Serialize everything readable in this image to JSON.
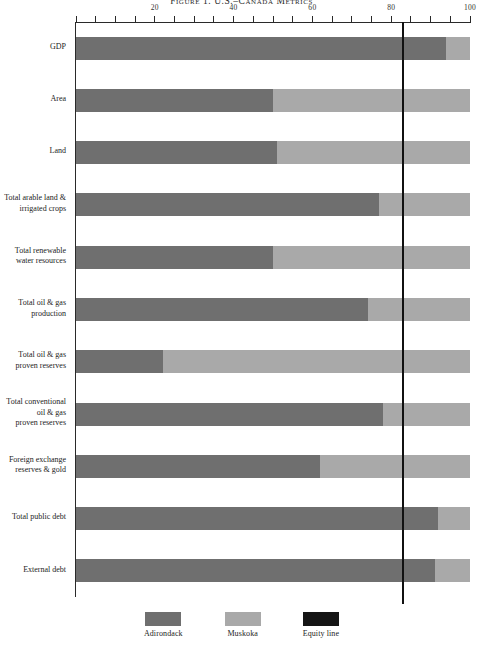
{
  "figure": {
    "title": "Figure 1. U.S.–Canada Metrics"
  },
  "axis": {
    "ticks": [
      {
        "value": 0,
        "label": ""
      },
      {
        "value": 5,
        "label": ""
      },
      {
        "value": 10,
        "label": ""
      },
      {
        "value": 15,
        "label": ""
      },
      {
        "value": 20,
        "label": "20"
      },
      {
        "value": 25,
        "label": ""
      },
      {
        "value": 30,
        "label": ""
      },
      {
        "value": 35,
        "label": ""
      },
      {
        "value": 40,
        "label": "40"
      },
      {
        "value": 45,
        "label": ""
      },
      {
        "value": 50,
        "label": ""
      },
      {
        "value": 55,
        "label": ""
      },
      {
        "value": 60,
        "label": "60"
      },
      {
        "value": 65,
        "label": ""
      },
      {
        "value": 70,
        "label": ""
      },
      {
        "value": 75,
        "label": ""
      },
      {
        "value": 80,
        "label": "80"
      },
      {
        "value": 85,
        "label": ""
      },
      {
        "value": 90,
        "label": ""
      },
      {
        "value": 95,
        "label": ""
      },
      {
        "value": 100,
        "label": "100"
      }
    ]
  },
  "legend": {
    "entries": [
      {
        "label": "Adirondack",
        "color": "#6f6f6f",
        "name": "legend-adirondack"
      },
      {
        "label": "Muskoka",
        "color": "#a9a9a9",
        "name": "legend-muskoka"
      },
      {
        "label": "Equity line",
        "color": "#151515",
        "name": "legend-equity-line"
      }
    ]
  },
  "colors": {
    "adirondack": "#6f6f6f",
    "muskoka": "#a9a9a9",
    "equity_line": "#111111",
    "axis": "#2a2a2a",
    "text": "#232323"
  },
  "chart_data": {
    "type": "bar",
    "orientation": "horizontal",
    "stacked": true,
    "normalized": true,
    "title": "Figure 1. U.S.–Canada Metrics",
    "xlabel": "",
    "ylabel": "",
    "xlim": [
      0,
      100
    ],
    "xticks": [
      0,
      20,
      40,
      60,
      80,
      100
    ],
    "grid": false,
    "legend_position": "bottom",
    "equity_line": 83,
    "categories": [
      "GDP",
      "Area",
      "Land",
      "Total arable land & irrigated crops",
      "Total renewable water resources",
      "Total oil & gas production",
      "Total oil & gas proven reserves",
      "Total conventional oil & gas proven reserves",
      "Foreign exchange reserves & gold",
      "Total public debt",
      "External debt"
    ],
    "category_lines": [
      [
        "GDP"
      ],
      [
        "Area"
      ],
      [
        "Land"
      ],
      [
        "Total arable land &",
        "irrigated crops"
      ],
      [
        "Total renewable",
        "water resources"
      ],
      [
        "Total oil & gas",
        "production"
      ],
      [
        "Total oil & gas",
        "proven reserves"
      ],
      [
        "Total conventional",
        "oil & gas",
        "proven reserves"
      ],
      [
        "Foreign exchange",
        "reserves & gold"
      ],
      [
        "Total public debt"
      ],
      [
        "External debt"
      ]
    ],
    "series": [
      {
        "name": "Adirondack",
        "color": "#6f6f6f",
        "values": [
          94,
          50,
          51,
          77,
          50,
          74,
          22,
          78,
          62,
          92,
          91
        ]
      },
      {
        "name": "Muskoka",
        "color": "#a9a9a9",
        "values": [
          6,
          50,
          49,
          23,
          50,
          26,
          78,
          22,
          38,
          8,
          9
        ]
      }
    ]
  }
}
